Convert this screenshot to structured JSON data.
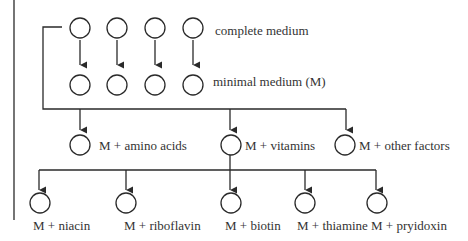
{
  "diagram": {
    "type": "flowchart",
    "rows": {
      "top": {
        "label": "complete medium",
        "plate_count": 4
      },
      "middle": {
        "label": "minimal medium (M)",
        "plate_count": 4
      },
      "supplements": [
        {
          "label": "M + amino acids"
        },
        {
          "label": "M + vitamins"
        },
        {
          "label": "M + other factors"
        }
      ],
      "vitamins": [
        {
          "label": "M + niacin"
        },
        {
          "label": "M + riboflavin"
        },
        {
          "label": "M + biotin"
        },
        {
          "label": "M + thiamine"
        },
        {
          "label": "M + pryidoxin"
        }
      ]
    },
    "colors": {
      "line": "#2a2a2a",
      "text": "#333333",
      "background": "#ffffff"
    }
  }
}
